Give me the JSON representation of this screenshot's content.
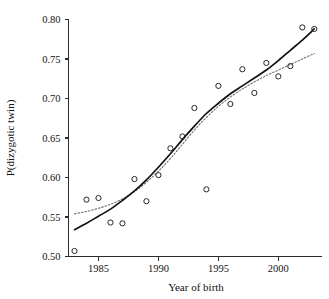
{
  "chart_data": {
    "type": "scatter",
    "title": "",
    "xlabel": "Year of birth",
    "ylabel": "P(dizygotic twin)",
    "xlim": [
      1982.5,
      2003.6
    ],
    "ylim": [
      0.5,
      0.8
    ],
    "grid": false,
    "legend": "none",
    "x_ticks": [
      1985,
      1990,
      1995,
      2000
    ],
    "x_tick_labels": [
      "1985",
      "1990",
      "1995",
      "2000"
    ],
    "y_ticks": [
      0.5,
      0.55,
      0.6,
      0.65,
      0.7,
      0.75,
      0.8
    ],
    "y_tick_labels": [
      "0.50",
      "0.55",
      "0.60",
      "0.65",
      "0.70",
      "0.75",
      "0.80"
    ],
    "marker": "open-circle",
    "marker_color": "#1b1b1b",
    "x": [
      1983,
      1984,
      1985,
      1986,
      1987,
      1988,
      1989,
      1990,
      1991,
      1992,
      1993,
      1994,
      1995,
      1996,
      1997,
      1998,
      1999,
      2000,
      2001,
      2002,
      2003
    ],
    "y": [
      0.507,
      0.572,
      0.574,
      0.543,
      0.542,
      0.598,
      0.57,
      0.603,
      0.637,
      0.652,
      0.688,
      0.585,
      0.716,
      0.693,
      0.737,
      0.707,
      0.745,
      0.728,
      0.741,
      0.79,
      0.788
    ],
    "series": [
      {
        "name": "observed",
        "type": "scatter",
        "x": [
          1983,
          1984,
          1985,
          1986,
          1987,
          1988,
          1989,
          1990,
          1991,
          1992,
          1993,
          1994,
          1995,
          1996,
          1997,
          1998,
          1999,
          2000,
          2001,
          2002,
          2003
        ],
        "values": [
          0.507,
          0.572,
          0.574,
          0.543,
          0.542,
          0.598,
          0.57,
          0.603,
          0.637,
          0.652,
          0.688,
          0.585,
          0.716,
          0.693,
          0.737,
          0.707,
          0.745,
          0.728,
          0.741,
          0.79,
          0.788
        ]
      },
      {
        "name": "fitted-solid",
        "type": "line",
        "style": "solid",
        "color": "#111111",
        "x": [
          1983,
          1984,
          1985,
          1986,
          1987,
          1988,
          1989,
          1990,
          1991,
          1992,
          1993,
          1994,
          1995,
          1996,
          1997,
          1998,
          1999,
          2000,
          2001,
          2002,
          2003
        ],
        "values": [
          0.534,
          0.542,
          0.551,
          0.56,
          0.571,
          0.583,
          0.597,
          0.613,
          0.63,
          0.648,
          0.665,
          0.681,
          0.694,
          0.706,
          0.716,
          0.726,
          0.736,
          0.748,
          0.761,
          0.774,
          0.788
        ]
      },
      {
        "name": "fitted-dotted",
        "type": "line",
        "style": "dotted",
        "color": "#6f6f6f",
        "x": [
          1983,
          1984,
          1985,
          1986,
          1987,
          1988,
          1989,
          1990,
          1991,
          1992,
          1993,
          1994,
          1995,
          1996,
          1997,
          1998,
          1999,
          2000,
          2001,
          2002,
          2003
        ],
        "values": [
          0.554,
          0.557,
          0.561,
          0.566,
          0.573,
          0.582,
          0.594,
          0.608,
          0.624,
          0.642,
          0.66,
          0.676,
          0.69,
          0.702,
          0.712,
          0.721,
          0.729,
          0.736,
          0.743,
          0.75,
          0.757
        ]
      }
    ]
  },
  "axes": {
    "x_title": "Year of birth",
    "y_title": "P(dizygotic twin)"
  }
}
